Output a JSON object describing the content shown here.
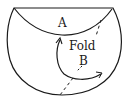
{
  "diagram": {
    "type": "folding-instruction",
    "labels": {
      "flap_a": "A",
      "fold": "Fold",
      "flap_b": "B"
    },
    "colors": {
      "stroke": "#1a1a1a",
      "background": "#ffffff"
    }
  }
}
